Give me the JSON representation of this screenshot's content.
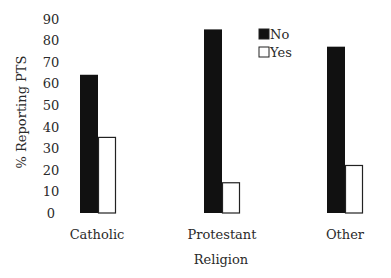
{
  "chart_data": {
    "type": "bar",
    "title": "",
    "xlabel": "Religion",
    "ylabel": "% Reporting PTS",
    "categories": [
      "Catholic",
      "Protestant",
      "Other"
    ],
    "series": [
      {
        "name": "No",
        "values": [
          64,
          85,
          77
        ],
        "color": "#111111"
      },
      {
        "name": "Yes",
        "values": [
          35,
          14,
          22
        ],
        "color": "#ffffff"
      }
    ],
    "ylim": [
      0,
      90
    ],
    "yticks": [
      0,
      10,
      20,
      30,
      40,
      50,
      60,
      70,
      80,
      90
    ],
    "grid": false,
    "legend_position": "top-right"
  }
}
